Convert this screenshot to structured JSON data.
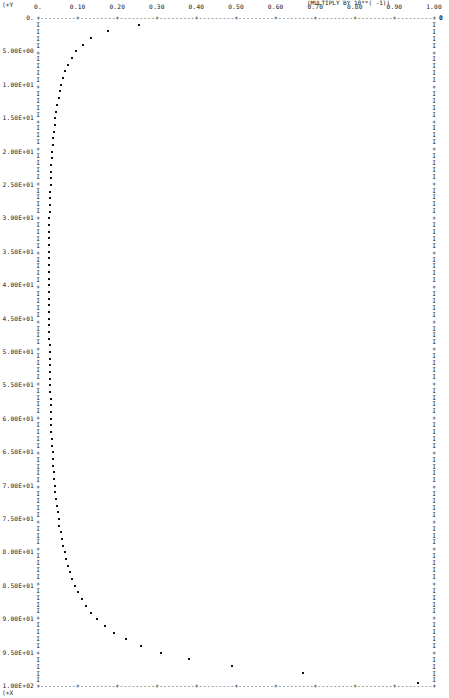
{
  "plot": {
    "corner_top_left": "(+Y",
    "corner_bottom_left": "(+X",
    "multiply_note": "(MULTIPLY BY 10**( -1))",
    "right_end_marker": "0",
    "origin_label": "0.",
    "border_glyph_vertical": "I",
    "border_glyph_tick": "+",
    "axis_dash_glyph": "-",
    "point_glyph": "*",
    "ink_color": "#161616",
    "background_color": "#ffffff"
  },
  "chart_data": {
    "type": "scatter",
    "title": "",
    "subtitle": "",
    "xlabel": "",
    "ylabel": "",
    "annotations": [
      "(MULTIPLY BY 10**( -1))"
    ],
    "grid": false,
    "legend": null,
    "x_axis_position": "top",
    "y_axis_direction": "down",
    "xlim": [
      0.0,
      1.0
    ],
    "ylim": [
      0.0,
      100.0
    ],
    "xticks": [
      0.0,
      0.1,
      0.2,
      0.3,
      0.4,
      0.5,
      0.6,
      0.7,
      0.8,
      0.9,
      1.0
    ],
    "xticklabels": [
      "0.",
      "0.10",
      "0.20",
      "0.30",
      "0.40",
      "0.50",
      "0.60",
      "0.70",
      "0.80",
      "0.90",
      "1.00"
    ],
    "yticks": [
      0.0,
      5.0,
      10.0,
      15.0,
      20.0,
      25.0,
      30.0,
      35.0,
      40.0,
      45.0,
      50.0,
      55.0,
      60.0,
      65.0,
      70.0,
      75.0,
      80.0,
      85.0,
      90.0,
      95.0,
      100.0
    ],
    "yticklabels": [
      "0.",
      "5.00E+00",
      "1.00E+01",
      "1.50E+01",
      "2.00E+01",
      "2.50E+01",
      "3.00E+01",
      "3.50E+01",
      "4.00E+01",
      "4.50E+01",
      "5.00E+01",
      "5.50E+01",
      "6.00E+01",
      "6.50E+01",
      "7.00E+01",
      "7.50E+01",
      "8.00E+01",
      "8.50E+01",
      "9.00E+01",
      "9.50E+01",
      "1.00E+02"
    ],
    "x": [
      0.255,
      0.177,
      0.133,
      0.113,
      0.097,
      0.085,
      0.076,
      0.069,
      0.063,
      0.059,
      0.055,
      0.052,
      0.049,
      0.046,
      0.044,
      0.042,
      0.04,
      0.039,
      0.037,
      0.036,
      0.035,
      0.034,
      0.033,
      0.032,
      0.032,
      0.031,
      0.031,
      0.03,
      0.03,
      0.029,
      0.029,
      0.029,
      0.029,
      0.029,
      0.029,
      0.029,
      0.029,
      0.029,
      0.029,
      0.029,
      0.029,
      0.029,
      0.029,
      0.029,
      0.029,
      0.029,
      0.029,
      0.029,
      0.03,
      0.03,
      0.03,
      0.03,
      0.03,
      0.031,
      0.031,
      0.031,
      0.032,
      0.032,
      0.033,
      0.033,
      0.034,
      0.034,
      0.035,
      0.036,
      0.037,
      0.038,
      0.039,
      0.04,
      0.041,
      0.043,
      0.044,
      0.046,
      0.048,
      0.05,
      0.052,
      0.054,
      0.057,
      0.06,
      0.063,
      0.067,
      0.071,
      0.076,
      0.081,
      0.087,
      0.094,
      0.102,
      0.111,
      0.122,
      0.135,
      0.15,
      0.169,
      0.192,
      0.221,
      0.259,
      0.31,
      0.382,
      0.49,
      0.67,
      0.96
    ],
    "y": [
      1.0,
      2.0,
      3.0,
      4.0,
      5.0,
      6.0,
      7.0,
      8.0,
      9.0,
      10.0,
      11.0,
      12.0,
      13.0,
      14.0,
      15.0,
      16.0,
      17.0,
      18.0,
      19.0,
      20.0,
      21.0,
      22.0,
      23.0,
      24.0,
      25.0,
      26.0,
      27.0,
      28.0,
      29.0,
      30.0,
      31.0,
      32.0,
      33.0,
      34.0,
      35.0,
      36.0,
      37.0,
      38.0,
      39.0,
      40.0,
      41.0,
      42.0,
      43.0,
      44.0,
      45.0,
      46.0,
      47.0,
      48.0,
      49.0,
      50.0,
      51.0,
      52.0,
      53.0,
      54.0,
      55.0,
      56.0,
      57.0,
      58.0,
      59.0,
      60.0,
      61.0,
      62.0,
      63.0,
      64.0,
      65.0,
      66.0,
      67.0,
      68.0,
      69.0,
      70.0,
      71.0,
      72.0,
      73.0,
      74.0,
      75.0,
      76.0,
      77.0,
      78.0,
      79.0,
      80.0,
      81.0,
      82.0,
      83.0,
      84.0,
      85.0,
      86.0,
      87.0,
      88.0,
      89.0,
      90.0,
      91.0,
      92.0,
      93.0,
      94.0,
      95.0,
      96.0,
      97.0,
      98.0,
      99.5
    ]
  }
}
